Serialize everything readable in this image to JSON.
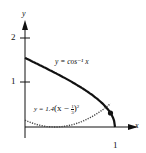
{
  "chart_data": {
    "type": "line",
    "title": "",
    "xlabel": "x",
    "ylabel": "y",
    "xlim": [
      0,
      1.1
    ],
    "ylim": [
      0,
      2.3
    ],
    "x_ticks": [
      {
        "value": 1,
        "label": "1"
      }
    ],
    "y_ticks": [
      {
        "value": 1,
        "label": "1"
      },
      {
        "value": 2,
        "label": "2"
      }
    ],
    "grid": false,
    "series": [
      {
        "name": "y = cos⁻¹ x",
        "style": "solid-thick",
        "color": "#111111",
        "x": [
          0,
          0.1,
          0.2,
          0.3,
          0.4,
          0.5,
          0.6,
          0.7,
          0.8,
          0.9,
          0.95,
          1.0
        ],
        "y": [
          1.571,
          1.471,
          1.369,
          1.266,
          1.159,
          1.047,
          0.927,
          0.795,
          0.644,
          0.451,
          0.318,
          0
        ]
      },
      {
        "name": "y = 1.4(x − 1/3)²",
        "style": "dotted",
        "color": "#333333",
        "x": [
          0,
          0.1,
          0.2,
          0.3333,
          0.4,
          0.5,
          0.6,
          0.7,
          0.8,
          0.9,
          0.95
        ],
        "y": [
          0.156,
          0.076,
          0.025,
          0,
          0.006,
          0.039,
          0.1,
          0.188,
          0.305,
          0.449,
          0.533
        ]
      }
    ],
    "annotations": [
      {
        "text": "y = cos⁻¹ x",
        "near": "upper curve"
      },
      {
        "text": "y = 1.4(x − 1/3)²",
        "near": "lower parabola"
      },
      {
        "type": "point",
        "x": 0.95,
        "y": 0.318,
        "label": "intersection"
      }
    ]
  },
  "labels": {
    "x_axis": "x",
    "y_axis": "y",
    "tick_x1": "1",
    "tick_y1": "1",
    "tick_y2": "2",
    "curve1": "y = cos⁻¹ x",
    "curve2_prefix": "y = 1.4",
    "curve2_body": "(x − ",
    "curve2_frac_num": "1",
    "curve2_frac_den": "3",
    "curve2_close": ")",
    "curve2_exp": "2"
  }
}
